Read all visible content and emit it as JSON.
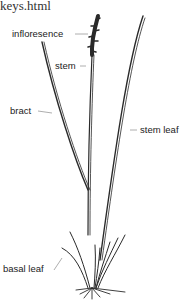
{
  "header": {
    "url_fragment": "keys.html"
  },
  "diagram": {
    "labels": [
      {
        "id": "inflorescence",
        "text": "infloresence"
      },
      {
        "id": "stem",
        "text": "stem"
      },
      {
        "id": "bract",
        "text": "bract"
      },
      {
        "id": "stem-leaf",
        "text": "stem leaf"
      },
      {
        "id": "basal-leaf",
        "text": "basal leaf"
      }
    ],
    "colors": {
      "line": "#2a2a2a",
      "leader": "#999999",
      "background": "#ffffff"
    }
  }
}
